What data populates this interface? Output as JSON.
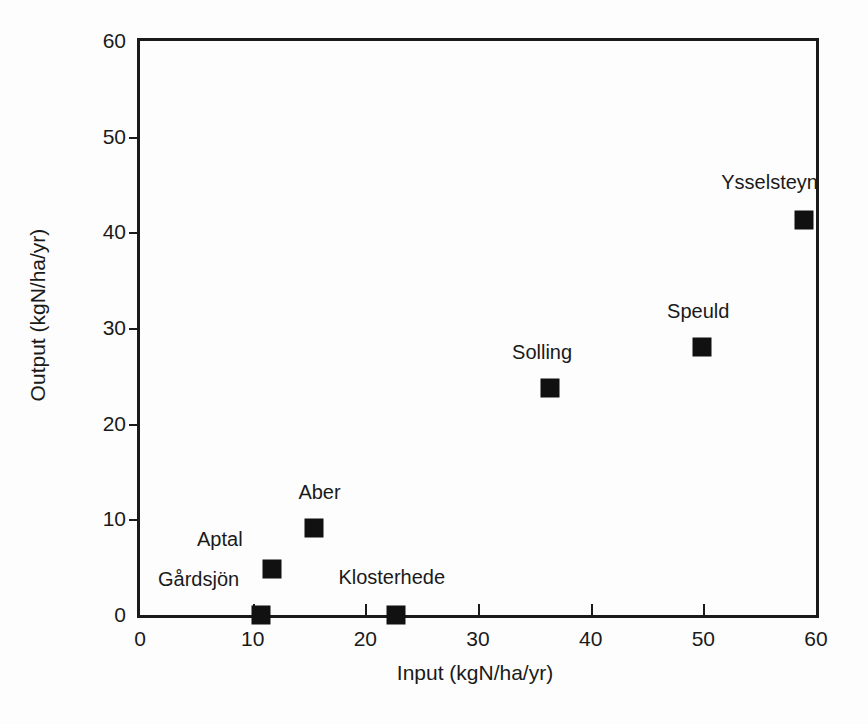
{
  "chart_data": {
    "type": "scatter",
    "title": "",
    "xlabel": "Input (kgN/ha/yr)",
    "ylabel": "Output (kgN/ha/yr)",
    "xlim": [
      0,
      60
    ],
    "ylim": [
      0,
      60
    ],
    "xticks": [
      0,
      10,
      20,
      30,
      40,
      50,
      60
    ],
    "yticks": [
      0,
      10,
      20,
      30,
      40,
      50,
      60
    ],
    "xticklabels": [
      "0",
      "10",
      "20",
      "30",
      "40",
      "50",
      "60"
    ],
    "yticklabels": [
      "0",
      "10",
      "20",
      "30",
      "40",
      "50",
      "60"
    ],
    "grid": false,
    "legend": false,
    "marker": "filled-square",
    "marker_color": "#111111",
    "points": [
      {
        "label": "Gårdsjön",
        "x": 10.7,
        "y": 0.0,
        "label_dx": -62,
        "label_dy": -14
      },
      {
        "label": "Aptal",
        "x": 11.7,
        "y": 4.8,
        "label_dx": -52,
        "label_dy": -8
      },
      {
        "label": "Aber",
        "x": 15.4,
        "y": 9.1,
        "label_dx": 6,
        "label_dy": -14
      },
      {
        "label": "Klosterhede",
        "x": 22.7,
        "y": 0.0,
        "label_dx": -4,
        "label_dy": -16
      },
      {
        "label": "Solling",
        "x": 36.4,
        "y": 23.7,
        "label_dx": -8,
        "label_dy": -14
      },
      {
        "label": "Speuld",
        "x": 49.9,
        "y": 28.0,
        "label_dx": -4,
        "label_dy": -14
      },
      {
        "label": "Ysselsteyn",
        "x": 58.9,
        "y": 41.3,
        "label_dx": -34,
        "label_dy": -16
      }
    ]
  },
  "axes": {
    "x_title": "Input (kgN/ha/yr)",
    "y_title": "Output (kgN/ha/yr)"
  }
}
